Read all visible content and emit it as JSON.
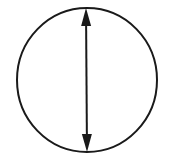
{
  "diagram": {
    "background": "#ffffff",
    "stroke_color": "#1a1a1a",
    "circle": {
      "cx": 87,
      "cy": 80,
      "rx": 70,
      "ry": 72,
      "stroke_width": 2
    },
    "arrow": {
      "type": "double-headed",
      "x1": 86,
      "y1": 8,
      "x2": 87,
      "y2": 152,
      "stroke_width": 2,
      "meaning": "diameter"
    }
  }
}
